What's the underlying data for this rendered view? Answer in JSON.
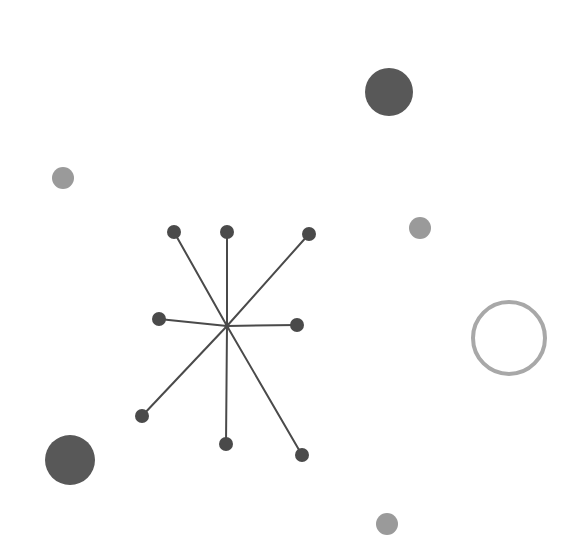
{
  "canvas": {
    "width": 580,
    "height": 546,
    "background": "#ffffff"
  },
  "palette": {
    "node_fill": "#4a4a4a",
    "spoke_stroke": "#4a4a4a",
    "large_dark_circle": "#585858",
    "medium_gray_circle": "#9a9a9a",
    "ring_stroke": "#a8a8a8",
    "ring_fill": "none"
  },
  "star_graph": {
    "label": "hub-and-spoke star node graph",
    "hub": {
      "x": 227,
      "y": 326
    },
    "spoke_width": 2,
    "node_radius": 7,
    "node_count": 8,
    "nodes": [
      {
        "name": "node-top-left",
        "x": 174,
        "y": 232
      },
      {
        "name": "node-top-center",
        "x": 227,
        "y": 232
      },
      {
        "name": "node-top-right",
        "x": 309,
        "y": 234
      },
      {
        "name": "node-left",
        "x": 159,
        "y": 319
      },
      {
        "name": "node-right",
        "x": 297,
        "y": 325
      },
      {
        "name": "node-bottom-left",
        "x": 142,
        "y": 416
      },
      {
        "name": "node-bottom-center",
        "x": 226,
        "y": 444
      },
      {
        "name": "node-bottom-right",
        "x": 302,
        "y": 455
      }
    ]
  },
  "scatter_circles": [
    {
      "name": "circle-large-dark-top-right",
      "x": 389,
      "y": 92,
      "r": 24,
      "fill": "#585858",
      "stroke": "none",
      "stroke_width": 0
    },
    {
      "name": "circle-small-gray-left",
      "x": 63,
      "y": 178,
      "r": 11,
      "fill": "#9a9a9a",
      "stroke": "none",
      "stroke_width": 0
    },
    {
      "name": "circle-small-gray-right",
      "x": 420,
      "y": 228,
      "r": 11,
      "fill": "#9a9a9a",
      "stroke": "none",
      "stroke_width": 0
    },
    {
      "name": "circle-outline-ring-right",
      "x": 509,
      "y": 338,
      "r": 36,
      "fill": "none",
      "stroke": "#a8a8a8",
      "stroke_width": 4
    },
    {
      "name": "circle-large-dark-bottom-left",
      "x": 70,
      "y": 460,
      "r": 25,
      "fill": "#585858",
      "stroke": "none",
      "stroke_width": 0
    },
    {
      "name": "circle-small-gray-bottom",
      "x": 387,
      "y": 524,
      "r": 11,
      "fill": "#9a9a9a",
      "stroke": "none",
      "stroke_width": 0
    }
  ]
}
